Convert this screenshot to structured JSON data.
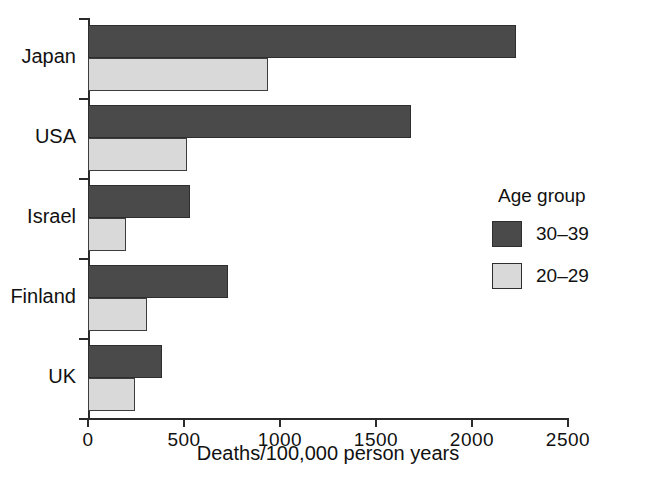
{
  "chart_data": {
    "type": "bar",
    "orientation": "horizontal",
    "title": "",
    "xlabel": "Deaths/100,000 person years",
    "ylabel": "",
    "categories": [
      "Japan",
      "USA",
      "Israel",
      "Finland",
      "UK"
    ],
    "series": [
      {
        "name": "30–39",
        "color": "#4a4a4a",
        "values": [
          2230,
          1680,
          530,
          730,
          385
        ]
      },
      {
        "name": "20–29",
        "color": "#d9d9d9",
        "values": [
          935,
          515,
          200,
          305,
          245
        ]
      }
    ],
    "xlim": [
      0,
      2500
    ],
    "xticks": [
      0,
      500,
      1000,
      1500,
      2000,
      2500
    ],
    "xtick_labels": [
      "0",
      "500",
      "1000",
      "1500",
      "2000",
      "2500"
    ],
    "grid": false,
    "legend": {
      "title": "Age group",
      "position": "right",
      "entries": [
        {
          "label": "30–39",
          "color": "#4a4a4a"
        },
        {
          "label": "20–29",
          "color": "#d9d9d9"
        }
      ]
    }
  }
}
